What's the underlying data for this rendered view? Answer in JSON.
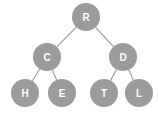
{
  "diagram": {
    "background_color": "#ffffff",
    "node_fill_color": "#9b9b9b",
    "node_label_color": "#ffffff",
    "edge_color": "#9a9a9a",
    "node_radius": 14,
    "nodes": [
      {
        "id": "R",
        "label": "R",
        "cx": 86,
        "cy": 17,
        "level": 0
      },
      {
        "id": "C",
        "label": "C",
        "cx": 47,
        "cy": 57,
        "level": 1
      },
      {
        "id": "D",
        "label": "D",
        "cx": 123,
        "cy": 57,
        "level": 1
      },
      {
        "id": "H",
        "label": "H",
        "cx": 25,
        "cy": 93,
        "level": 2
      },
      {
        "id": "E",
        "label": "E",
        "cx": 62,
        "cy": 93,
        "level": 2
      },
      {
        "id": "T",
        "label": "T",
        "cx": 104,
        "cy": 93,
        "level": 2
      },
      {
        "id": "L",
        "label": "L",
        "cx": 139,
        "cy": 93,
        "level": 2
      }
    ],
    "edges": [
      {
        "from": "R",
        "to": "C",
        "x1": 86,
        "y1": 17,
        "x2": 47,
        "y2": 57
      },
      {
        "from": "R",
        "to": "D",
        "x1": 86,
        "y1": 17,
        "x2": 123,
        "y2": 57
      },
      {
        "from": "C",
        "to": "H",
        "x1": 47,
        "y1": 57,
        "x2": 25,
        "y2": 93
      },
      {
        "from": "C",
        "to": "E",
        "x1": 47,
        "y1": 57,
        "x2": 62,
        "y2": 93
      },
      {
        "from": "D",
        "to": "T",
        "x1": 123,
        "y1": 57,
        "x2": 104,
        "y2": 93
      },
      {
        "from": "D",
        "to": "L",
        "x1": 123,
        "y1": 57,
        "x2": 139,
        "y2": 93
      }
    ]
  }
}
